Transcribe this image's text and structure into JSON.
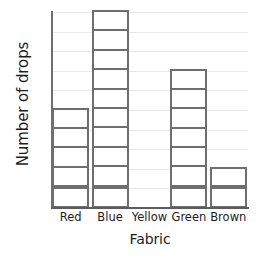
{
  "chart_data": {
    "type": "bar",
    "title": "",
    "xlabel": "Fabric",
    "ylabel": "Number of drops",
    "categories": [
      "Red",
      "Blue",
      "Yellow",
      "Green",
      "Brown"
    ],
    "values": [
      5,
      10,
      0,
      7,
      2
    ],
    "ylim": [
      0,
      10
    ],
    "y_tick_labels": [],
    "grid": true,
    "gridline_count": 10,
    "legend": null,
    "style": {
      "bar_fill": "#ffffff",
      "bar_border": "#6e6e6e",
      "gridline_color": "#e9e9e9",
      "axis_color": "#6f6f6f",
      "text_color": "#1c1c1c",
      "background": "#ffffff"
    }
  }
}
